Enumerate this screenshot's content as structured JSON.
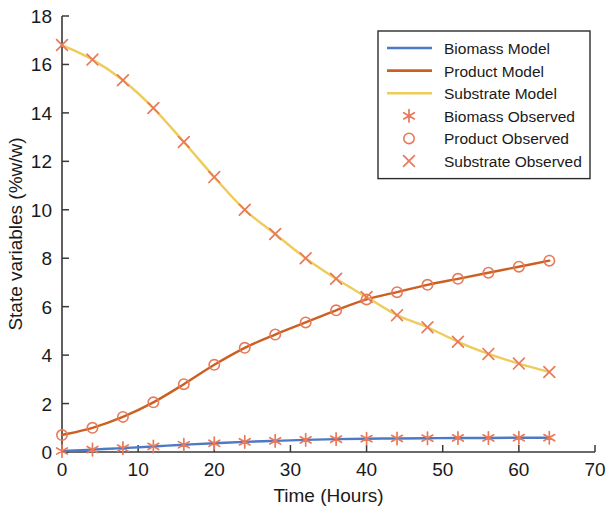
{
  "chart_data": {
    "type": "line",
    "title": "",
    "xlabel": "Time (Hours)",
    "ylabel": "State variables (%w/w)",
    "xlim": [
      0,
      70
    ],
    "ylim": [
      0,
      18
    ],
    "xticks": [
      0,
      10,
      20,
      30,
      40,
      50,
      60,
      70
    ],
    "yticks": [
      0,
      2,
      4,
      6,
      8,
      10,
      12,
      14,
      16,
      18
    ],
    "grid": false,
    "legend_position": "upper right",
    "colors": {
      "biomass": "#4e79c4",
      "product": "#cb6021",
      "substrate": "#edcc5a",
      "marker": "#e8795a",
      "axis": "#3a3a3a",
      "text": "#1a1a1a"
    },
    "x": [
      0,
      4,
      8,
      12,
      16,
      20,
      24,
      28,
      32,
      36,
      40,
      44,
      48,
      52,
      56,
      60,
      64
    ],
    "series": [
      {
        "name": "Biomass Model",
        "kind": "line",
        "color_key": "biomass",
        "values": [
          0.04,
          0.1,
          0.16,
          0.23,
          0.3,
          0.36,
          0.42,
          0.46,
          0.5,
          0.53,
          0.55,
          0.56,
          0.57,
          0.58,
          0.58,
          0.59,
          0.59
        ]
      },
      {
        "name": "Product Model",
        "kind": "line",
        "color_key": "product",
        "values": [
          0.7,
          1.0,
          1.45,
          2.05,
          2.8,
          3.6,
          4.3,
          4.85,
          5.35,
          5.85,
          6.3,
          6.6,
          6.9,
          7.15,
          7.4,
          7.65,
          7.9
        ]
      },
      {
        "name": "Substrate Model",
        "kind": "line",
        "color_key": "substrate",
        "values": [
          16.8,
          16.2,
          15.35,
          14.2,
          12.8,
          11.35,
          10.0,
          9.0,
          8.0,
          7.15,
          6.4,
          5.65,
          5.15,
          4.55,
          4.05,
          3.65,
          3.3
        ]
      },
      {
        "name": "Biomass Observed",
        "kind": "marker",
        "marker": "asterisk",
        "color_key": "marker",
        "values": [
          0.04,
          0.1,
          0.16,
          0.23,
          0.3,
          0.36,
          0.42,
          0.46,
          0.5,
          0.53,
          0.55,
          0.56,
          0.57,
          0.58,
          0.58,
          0.59,
          0.59
        ]
      },
      {
        "name": "Product Observed",
        "kind": "marker",
        "marker": "circle",
        "color_key": "marker",
        "values": [
          0.7,
          1.0,
          1.45,
          2.05,
          2.8,
          3.6,
          4.3,
          4.85,
          5.35,
          5.85,
          6.3,
          6.6,
          6.9,
          7.15,
          7.4,
          7.65,
          7.9
        ]
      },
      {
        "name": "Substrate Observed",
        "kind": "marker",
        "marker": "x",
        "color_key": "marker",
        "values": [
          16.8,
          16.2,
          15.35,
          14.2,
          12.8,
          11.35,
          10.0,
          9.0,
          8.0,
          7.15,
          6.4,
          5.65,
          5.15,
          4.55,
          4.05,
          3.65,
          3.3
        ]
      }
    ],
    "legend_entries": [
      {
        "label": "Biomass Model",
        "kind": "line",
        "color_key": "biomass"
      },
      {
        "label": "Product Model",
        "kind": "line",
        "color_key": "product"
      },
      {
        "label": "Substrate Model",
        "kind": "line",
        "color_key": "substrate"
      },
      {
        "label": "Biomass Observed",
        "kind": "marker",
        "marker": "asterisk",
        "color_key": "marker"
      },
      {
        "label": "Product Observed",
        "kind": "marker",
        "marker": "circle",
        "color_key": "marker"
      },
      {
        "label": "Substrate Observed",
        "kind": "marker",
        "marker": "x",
        "color_key": "marker"
      }
    ]
  }
}
